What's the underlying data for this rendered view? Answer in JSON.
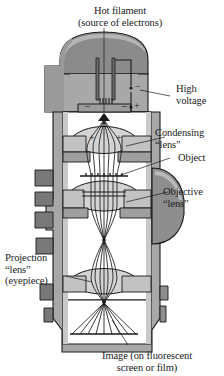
{
  "figure": {
    "type": "cross-section-diagram",
    "labels": {
      "hot_filament_line1": "Hot filament",
      "hot_filament_line2": "(source of electrons)",
      "high_voltage_line1": "High",
      "high_voltage_line2": "voltage",
      "condensing_lens_line1": "Condensing",
      "condensing_lens_line2": "“lens”",
      "object": "Object",
      "objective_lens_line1": "Objective",
      "objective_lens_line2": "“lens”",
      "projection_lens_line1": "Projection",
      "projection_lens_line2": "“lens”",
      "projection_lens_line3": "(eyepiece)",
      "image_line1": "Image (on fluorescent",
      "image_line2": "screen or film)"
    },
    "polarity_marks": {
      "wehnelt_left": "−",
      "wehnelt_right": "−",
      "anode_plus": "+",
      "hv_minus": "−",
      "hv_plus": "+",
      "condenser_left_plus": "+",
      "condenser_right_plus": "+"
    },
    "colors": {
      "page_background": "#ffffff",
      "metal_body": "#a8a8a8",
      "metal_dark": "#7d7d7d",
      "metal_light": "#cfcfcf",
      "lens_fill": "#d9d9d9",
      "interior": "#ffffff",
      "outline": "#1a1a1a",
      "text": "#1a1a1a"
    }
  }
}
